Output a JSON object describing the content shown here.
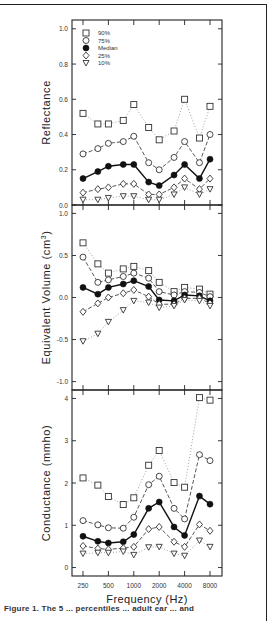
{
  "chart_data": [
    {
      "type": "line",
      "title": "",
      "xlabel": "",
      "ylabel": "Reflectance",
      "ylim": [
        0.0,
        1.0
      ],
      "yticks": [
        "0.0",
        "0.2",
        "0.4",
        "0.6",
        "0.8",
        "1.0"
      ],
      "x": [
        250,
        375,
        500,
        750,
        1000,
        1500,
        2000,
        3000,
        4000,
        6000,
        8000
      ],
      "legend": [
        "90%",
        "75%",
        "Median",
        "25%",
        "10%"
      ],
      "legend_position": "upper-left",
      "series": [
        {
          "name": "90%",
          "values": [
            0.52,
            0.46,
            0.46,
            0.48,
            0.57,
            0.44,
            0.37,
            0.42,
            0.6,
            0.38,
            0.56
          ]
        },
        {
          "name": "75%",
          "values": [
            0.29,
            0.32,
            0.35,
            0.36,
            0.39,
            0.24,
            0.2,
            0.27,
            0.36,
            0.24,
            0.4
          ]
        },
        {
          "name": "Median",
          "values": [
            0.15,
            0.19,
            0.22,
            0.23,
            0.23,
            0.13,
            0.11,
            0.17,
            0.23,
            0.15,
            0.26
          ]
        },
        {
          "name": "25%",
          "values": [
            0.07,
            0.09,
            0.1,
            0.12,
            0.12,
            0.06,
            0.06,
            0.1,
            0.15,
            0.09,
            0.15
          ]
        },
        {
          "name": "10%",
          "values": [
            0.03,
            0.03,
            0.04,
            0.05,
            0.05,
            0.03,
            0.03,
            0.06,
            0.1,
            0.06,
            0.09
          ]
        }
      ]
    },
    {
      "type": "line",
      "title": "",
      "xlabel": "",
      "ylabel": "Equivalent Volume (cm³)",
      "ylim": [
        -1.0,
        1.0
      ],
      "yticks": [
        "-1.0",
        "-0.5",
        "0.0",
        "0.5",
        "1.0"
      ],
      "x": [
        250,
        375,
        500,
        750,
        1000,
        1500,
        2000,
        3000,
        4000,
        6000,
        8000
      ],
      "series": [
        {
          "name": "90%",
          "values": [
            0.65,
            0.4,
            0.29,
            0.34,
            0.37,
            0.32,
            0.18,
            0.07,
            0.12,
            0.1,
            0.04
          ]
        },
        {
          "name": "75%",
          "values": [
            0.48,
            0.18,
            0.21,
            0.25,
            0.29,
            0.23,
            0.07,
            0.03,
            0.07,
            0.06,
            0.01
          ]
        },
        {
          "name": "Median",
          "values": [
            0.12,
            0.04,
            0.12,
            0.16,
            0.2,
            0.13,
            -0.03,
            -0.04,
            0.03,
            0.02,
            -0.04
          ]
        },
        {
          "name": "25%",
          "values": [
            -0.17,
            -0.07,
            0.0,
            0.05,
            0.09,
            0.01,
            -0.08,
            -0.08,
            -0.01,
            -0.01,
            -0.07
          ]
        },
        {
          "name": "10%",
          "values": [
            -0.52,
            -0.43,
            -0.29,
            -0.15,
            -0.04,
            -0.06,
            -0.12,
            -0.1,
            -0.03,
            -0.04,
            -0.1
          ]
        }
      ]
    },
    {
      "type": "line",
      "title": "",
      "xlabel": "Frequency (Hz)",
      "ylabel": "Conductance (mmho)",
      "ylim": [
        0,
        4.2
      ],
      "yticks": [
        "0",
        "1",
        "2",
        "3",
        "4"
      ],
      "x": [
        250,
        375,
        500,
        750,
        1000,
        1500,
        2000,
        3000,
        4000,
        6000,
        8000
      ],
      "xticks": [
        "250",
        "500",
        "1000",
        "2000",
        "4000",
        "8000"
      ],
      "series": [
        {
          "name": "90%",
          "values": [
            2.12,
            1.95,
            1.68,
            1.49,
            1.65,
            2.42,
            2.77,
            2.01,
            1.9,
            4.02,
            3.96
          ]
        },
        {
          "name": "75%",
          "values": [
            1.11,
            1.01,
            0.94,
            0.93,
            1.19,
            1.96,
            2.16,
            1.4,
            1.15,
            2.67,
            2.53
          ]
        },
        {
          "name": "Median",
          "values": [
            0.74,
            0.62,
            0.58,
            0.61,
            0.78,
            1.4,
            1.55,
            0.96,
            0.76,
            1.69,
            1.5
          ]
        },
        {
          "name": "25%",
          "values": [
            0.51,
            0.45,
            0.43,
            0.46,
            0.49,
            0.91,
            0.96,
            0.61,
            0.49,
            1.02,
            0.87
          ]
        },
        {
          "name": "10%",
          "values": [
            0.33,
            0.35,
            0.35,
            0.38,
            0.3,
            0.48,
            0.49,
            0.33,
            0.28,
            0.64,
            0.49
          ]
        }
      ]
    }
  ],
  "panels": {
    "top": {
      "ylabel": "Reflectance"
    },
    "middle": {
      "ylabel": "Equivalent Volume (cm",
      "ylabel_sup": "3",
      "ylabel_close": ")"
    },
    "bottom": {
      "ylabel": "Conductance (mmho)",
      "xlabel": "Frequency (Hz)"
    }
  },
  "legend": {
    "items": [
      {
        "label": "90%",
        "marker": "square-open"
      },
      {
        "label": "75%",
        "marker": "circle-open"
      },
      {
        "label": "Median",
        "marker": "circle-filled"
      },
      {
        "label": "25%",
        "marker": "diamond-open"
      },
      {
        "label": "10%",
        "marker": "triangle-down-open"
      }
    ]
  },
  "caption": {
    "text": "Figure 1. The 5 ... percentiles ... adult ear ... and"
  }
}
